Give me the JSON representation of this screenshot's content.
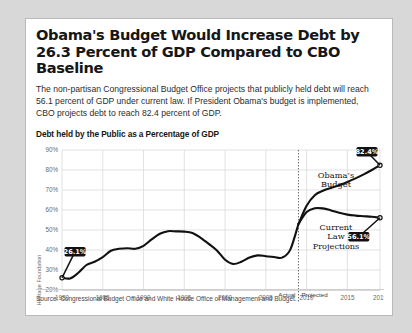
{
  "card": {
    "title": "Obama's Budget Would Increase Debt by 26.3 Percent of GDP Compared to CBO Baseline",
    "subtitle": "The non-partisan Congressional Budget Office projects that publicly held debt will reach 56.1 percent of GDP under current law. If President Obama's budget is implemented, CBO projects debt to reach 82.4 percent of GDP.",
    "source": "Source: Congressional Budget Office and White House Office of Management and Budget.",
    "credit": "Heritage Foundation"
  },
  "chart_data": {
    "type": "line",
    "title": "Debt held by the Public as a Percentage of GDP",
    "xlabel": "",
    "ylabel": "",
    "xlim": [
      1980,
      2019
    ],
    "ylim": [
      20,
      90
    ],
    "ytick_labels": [
      "90%",
      "80%",
      "70%",
      "60%",
      "50%",
      "40%",
      "30%",
      "20%"
    ],
    "ytick_values": [
      90,
      80,
      70,
      60,
      50,
      40,
      30,
      20
    ],
    "xtick_labels": [
      "1980",
      "1985",
      "1990",
      "1995",
      "2000",
      "2005",
      "2010",
      "2015",
      "2019"
    ],
    "xtick_values": [
      1980,
      1985,
      1990,
      1995,
      2000,
      2005,
      2010,
      2015,
      2019
    ],
    "grid": true,
    "legend_position": "inline-annotations",
    "divider_year": 2009,
    "period_labels": {
      "actual": "Actual",
      "projected": "Projected"
    },
    "series": [
      {
        "name": "Historical",
        "x": [
          1980,
          1981,
          1982,
          1983,
          1984,
          1985,
          1986,
          1987,
          1988,
          1989,
          1990,
          1991,
          1992,
          1993,
          1994,
          1995,
          1996,
          1997,
          1998,
          1999,
          2000,
          2001,
          2002,
          2003,
          2004,
          2005,
          2006,
          2007,
          2008,
          2009
        ],
        "values": [
          26.1,
          25.8,
          28.6,
          32.5,
          34.1,
          36.4,
          39.6,
          40.6,
          40.9,
          40.6,
          42.1,
          45.3,
          48.1,
          49.4,
          49.3,
          49.2,
          48.5,
          46.1,
          43.1,
          39.8,
          35.1,
          33.0,
          34.1,
          36.2,
          37.3,
          36.9,
          36.5,
          36.2,
          40.2,
          53.0
        ]
      },
      {
        "name": "Obama's Budget",
        "x": [
          2009,
          2010,
          2011,
          2012,
          2013,
          2014,
          2015,
          2016,
          2017,
          2018,
          2019
        ],
        "values": [
          53.0,
          62.1,
          67.4,
          69.6,
          71.0,
          72.4,
          74.0,
          75.8,
          77.8,
          80.0,
          82.4
        ]
      },
      {
        "name": "Current Law Projections",
        "x": [
          2009,
          2010,
          2011,
          2012,
          2013,
          2014,
          2015,
          2016,
          2017,
          2018,
          2019
        ],
        "values": [
          53.0,
          59.0,
          60.9,
          60.8,
          59.8,
          58.6,
          57.7,
          57.2,
          56.9,
          56.6,
          56.1
        ]
      }
    ],
    "annotations": [
      {
        "name": "start-value",
        "label": "26.1%",
        "year": 1980,
        "value": 26.1
      },
      {
        "name": "obama-end-value",
        "label": "82.4%",
        "year": 2019,
        "value": 82.4
      },
      {
        "name": "current-law-end-value",
        "label": "56.1%",
        "year": 2019,
        "value": 56.1
      },
      {
        "name": "obama-series-label",
        "label": "Obama's Budget"
      },
      {
        "name": "current-law-series-label",
        "label": "Current Law Projections"
      }
    ],
    "colors": {
      "line": "#111111",
      "grid": "#d5d5d5",
      "callout_bg": "#111111",
      "callout_text": "#ffffff",
      "axis_text": "#6a6a6a"
    }
  }
}
